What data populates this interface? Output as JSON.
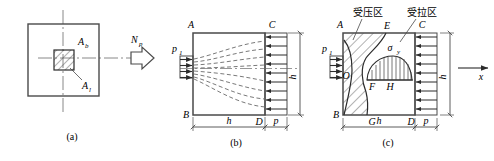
{
  "figure": {
    "title_visible": false,
    "panel_count": 3,
    "colors": {
      "line": "#4a4a4a",
      "dark": "#2b2b2b",
      "hatch": "#555555",
      "dash": "#6a6a6a",
      "text": "#1a1a1a"
    }
  },
  "panels": [
    {
      "key": "a",
      "caption": "(a)",
      "name": "panel-a-plan-view",
      "labels": {
        "area_bearing": "A",
        "area_bearing_sub": "b",
        "area_local": "A",
        "area_local_sub": "l"
      }
    },
    {
      "key": "b",
      "caption": "(b)",
      "name": "panel-b-stress-diffusion",
      "labels": {
        "corner_top_left": "A",
        "corner_top_right": "C",
        "corner_bottom_left": "B",
        "corner_bottom_right": "D",
        "load_left": "p",
        "load_left_sub": "1",
        "dim_height": "h",
        "dim_bottom": "h",
        "dim_bottom_right": "p"
      }
    },
    {
      "key": "c",
      "caption": "(c)",
      "name": "panel-c-stress-zones",
      "labels": {
        "corner_top_left": "A",
        "corner_top_right": "C",
        "corner_bottom_left": "B",
        "corner_bottom_right": "D",
        "point_o": "O",
        "point_e": "E",
        "point_f": "F",
        "point_g": "G",
        "point_h": "H",
        "sigma": "σ",
        "sigma_sub": "y",
        "load_left": "p",
        "load_left_sub": "1",
        "dim_height": "h",
        "dim_bottom": "h",
        "dim_bottom_right": "p",
        "zone_compression": "受压区",
        "zone_tension": "受拉区",
        "axis_x": "x"
      }
    }
  ],
  "arrow_between_a_b": {
    "label": "N",
    "label_sub": "p",
    "name": "load-arrow-np"
  }
}
